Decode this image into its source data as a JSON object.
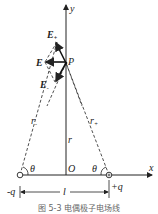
{
  "diagram": {
    "axes": {
      "x_label": "x",
      "y_label": "y",
      "origin_label": "O"
    },
    "point": {
      "label": "P"
    },
    "vectors": {
      "e_total": {
        "label": "E"
      },
      "e_plus": {
        "label": "E",
        "sub": "+"
      },
      "e_minus": {
        "label": "E",
        "sub": "-"
      }
    },
    "distances": {
      "r_minus": {
        "label": "r",
        "sub": "-"
      },
      "r_plus": {
        "label": "r",
        "sub": "+"
      },
      "r": {
        "label": "r"
      },
      "l": {
        "label": "l"
      }
    },
    "angles": {
      "left": "θ",
      "right": "θ"
    },
    "charges": {
      "negative": "-q",
      "positive": "+q"
    },
    "caption": "图 5-3  电偶极子电场线"
  }
}
